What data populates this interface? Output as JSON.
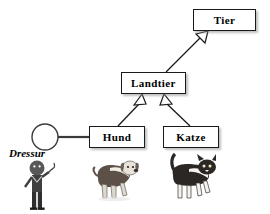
{
  "diagram": {
    "type": "uml-class-diagram",
    "title": "",
    "background_color": "#ffffff",
    "line_color": "#1a1a1a",
    "box_fill": "#ffffff",
    "classes": [
      {
        "id": "tier",
        "label": "Tier",
        "x": 193,
        "y": 9,
        "w": 63,
        "h": 22
      },
      {
        "id": "landtier",
        "label": "Landtier",
        "x": 121,
        "y": 72,
        "w": 65,
        "h": 22
      },
      {
        "id": "hund",
        "label": "Hund",
        "x": 89,
        "y": 126,
        "w": 56,
        "h": 22
      },
      {
        "id": "katze",
        "label": "Katze",
        "x": 163,
        "y": 126,
        "w": 56,
        "h": 22
      }
    ],
    "interfaces": [
      {
        "id": "dressur",
        "label": "Dressur",
        "notation": "lollipop",
        "circle": {
          "cx": 45,
          "cy": 137,
          "r": 13
        },
        "label_x": 9,
        "label_y": 147,
        "connected_to": "hund"
      }
    ],
    "generalizations": [
      {
        "from": "landtier",
        "to": "tier",
        "arrow": "hollow-triangle"
      },
      {
        "from": "hund",
        "to": "landtier",
        "arrow": "hollow-triangle"
      },
      {
        "from": "katze",
        "to": "landtier",
        "arrow": "hollow-triangle"
      }
    ],
    "illustrations": [
      {
        "id": "trainer",
        "depicts": "person-with-whip",
        "x": 20,
        "y": 160,
        "w": 42,
        "h": 50
      },
      {
        "id": "dog",
        "depicts": "dog",
        "x": 92,
        "y": 158,
        "w": 48,
        "h": 44
      },
      {
        "id": "cat",
        "depicts": "cat",
        "x": 163,
        "y": 153,
        "w": 52,
        "h": 50
      }
    ]
  }
}
